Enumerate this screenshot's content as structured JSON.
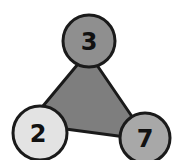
{
  "diagram": {
    "type": "fact-family-triangle",
    "triangle": {
      "fill": "#7e7e7e",
      "stroke": "#1a1a1a"
    },
    "nodes": [
      {
        "position": "top",
        "value": "3",
        "fill": "#8f8f8f"
      },
      {
        "position": "bottom-left",
        "value": "2",
        "fill": "#e3e3e3"
      },
      {
        "position": "bottom-right",
        "value": "7",
        "fill": "#a8a8a8"
      }
    ]
  }
}
